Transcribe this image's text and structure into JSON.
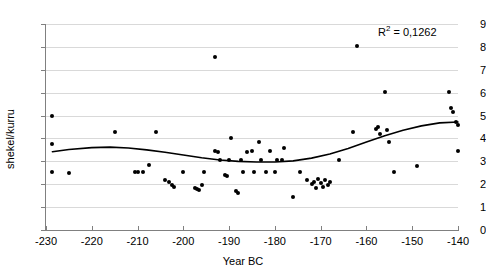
{
  "chart_data": {
    "type": "scatter",
    "title": "",
    "xlabel": "Year BC",
    "ylabel": "shekel/kurru",
    "xlim": [
      -230,
      -140
    ],
    "ylim": [
      0,
      9
    ],
    "xticks": [
      -230,
      -220,
      -210,
      -200,
      -190,
      -180,
      -170,
      -160,
      -150,
      -140
    ],
    "yticks": [
      0,
      1,
      2,
      3,
      4,
      5,
      6,
      7,
      8,
      9
    ],
    "grid": true,
    "legend": "none",
    "annotations": [
      {
        "text": "R2 = 0,1262",
        "display": "R",
        "sup": "2",
        "rest": " = 0,1262",
        "x": -147,
        "y": 8.6
      }
    ],
    "points": [
      {
        "x": -228.6,
        "y": 5.0
      },
      {
        "x": -228.6,
        "y": 3.75
      },
      {
        "x": -228.6,
        "y": 2.55
      },
      {
        "x": -225.0,
        "y": 2.5
      },
      {
        "x": -215.0,
        "y": 4.3
      },
      {
        "x": -210.5,
        "y": 2.55
      },
      {
        "x": -209.8,
        "y": 2.55
      },
      {
        "x": -208.8,
        "y": 2.55
      },
      {
        "x": -207.5,
        "y": 2.85
      },
      {
        "x": -206.0,
        "y": 4.3
      },
      {
        "x": -204.0,
        "y": 2.2
      },
      {
        "x": -203.2,
        "y": 2.1
      },
      {
        "x": -202.5,
        "y": 1.95
      },
      {
        "x": -202.0,
        "y": 1.9
      },
      {
        "x": -200.0,
        "y": 2.55
      },
      {
        "x": -197.5,
        "y": 1.85
      },
      {
        "x": -197.0,
        "y": 1.8
      },
      {
        "x": -196.5,
        "y": 1.75
      },
      {
        "x": -196.0,
        "y": 1.95
      },
      {
        "x": -195.5,
        "y": 2.55
      },
      {
        "x": -193.0,
        "y": 7.55
      },
      {
        "x": -193.0,
        "y": 3.45
      },
      {
        "x": -192.5,
        "y": 3.4
      },
      {
        "x": -192.0,
        "y": 3.05
      },
      {
        "x": -191.0,
        "y": 2.4
      },
      {
        "x": -190.5,
        "y": 2.35
      },
      {
        "x": -190.0,
        "y": 3.05
      },
      {
        "x": -189.5,
        "y": 4.0
      },
      {
        "x": -188.5,
        "y": 1.7
      },
      {
        "x": -188.0,
        "y": 1.6
      },
      {
        "x": -187.5,
        "y": 3.05
      },
      {
        "x": -187.0,
        "y": 2.55
      },
      {
        "x": -186.0,
        "y": 3.4
      },
      {
        "x": -185.0,
        "y": 3.45
      },
      {
        "x": -184.5,
        "y": 2.55
      },
      {
        "x": -183.5,
        "y": 3.85
      },
      {
        "x": -183.0,
        "y": 3.05
      },
      {
        "x": -182.0,
        "y": 2.55
      },
      {
        "x": -181.0,
        "y": 3.45
      },
      {
        "x": -180.0,
        "y": 2.55
      },
      {
        "x": -179.5,
        "y": 3.05
      },
      {
        "x": -178.5,
        "y": 3.05
      },
      {
        "x": -178.0,
        "y": 3.6
      },
      {
        "x": -176.0,
        "y": 1.45
      },
      {
        "x": -174.5,
        "y": 2.55
      },
      {
        "x": -173.0,
        "y": 2.2
      },
      {
        "x": -172.0,
        "y": 2.0
      },
      {
        "x": -171.5,
        "y": 2.1
      },
      {
        "x": -171.0,
        "y": 1.85
      },
      {
        "x": -170.5,
        "y": 2.25
      },
      {
        "x": -170.0,
        "y": 2.05
      },
      {
        "x": -169.5,
        "y": 1.9
      },
      {
        "x": -169.0,
        "y": 2.2
      },
      {
        "x": -168.5,
        "y": 1.95
      },
      {
        "x": -168.0,
        "y": 2.1
      },
      {
        "x": -166.0,
        "y": 3.05
      },
      {
        "x": -163.0,
        "y": 4.3
      },
      {
        "x": -162.0,
        "y": 8.05
      },
      {
        "x": -158.0,
        "y": 4.4
      },
      {
        "x": -157.5,
        "y": 4.5
      },
      {
        "x": -157.0,
        "y": 4.2
      },
      {
        "x": -156.0,
        "y": 6.05
      },
      {
        "x": -155.5,
        "y": 4.35
      },
      {
        "x": -155.0,
        "y": 3.85
      },
      {
        "x": -154.0,
        "y": 2.55
      },
      {
        "x": -149.0,
        "y": 2.8
      },
      {
        "x": -142.0,
        "y": 6.05
      },
      {
        "x": -141.5,
        "y": 5.35
      },
      {
        "x": -141.0,
        "y": 5.15
      },
      {
        "x": -140.5,
        "y": 4.7
      },
      {
        "x": -140.0,
        "y": 4.6
      },
      {
        "x": -140.0,
        "y": 3.45
      }
    ],
    "trendline": {
      "type": "polynomial",
      "r_squared": 0.1262,
      "points": [
        {
          "x": -228.6,
          "y": 3.42
        },
        {
          "x": -225.0,
          "y": 3.52
        },
        {
          "x": -220.0,
          "y": 3.6
        },
        {
          "x": -216.0,
          "y": 3.62
        },
        {
          "x": -212.0,
          "y": 3.58
        },
        {
          "x": -208.0,
          "y": 3.5
        },
        {
          "x": -204.0,
          "y": 3.4
        },
        {
          "x": -200.0,
          "y": 3.28
        },
        {
          "x": -196.0,
          "y": 3.16
        },
        {
          "x": -192.0,
          "y": 3.06
        },
        {
          "x": -188.0,
          "y": 3.0
        },
        {
          "x": -184.0,
          "y": 2.97
        },
        {
          "x": -180.0,
          "y": 2.97
        },
        {
          "x": -176.0,
          "y": 3.02
        },
        {
          "x": -172.0,
          "y": 3.14
        },
        {
          "x": -168.0,
          "y": 3.32
        },
        {
          "x": -164.0,
          "y": 3.56
        },
        {
          "x": -160.0,
          "y": 3.84
        },
        {
          "x": -156.0,
          "y": 4.12
        },
        {
          "x": -152.0,
          "y": 4.36
        },
        {
          "x": -148.0,
          "y": 4.55
        },
        {
          "x": -144.0,
          "y": 4.68
        },
        {
          "x": -140.0,
          "y": 4.72
        }
      ]
    }
  }
}
